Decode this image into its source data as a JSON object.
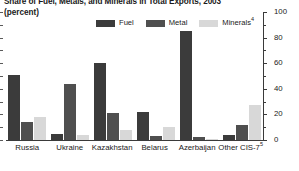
{
  "title": {
    "line1": "Share of Fuel, Metals, and Minerals in Total Exports, 2003",
    "line1_sup": "3",
    "line2": "(percent)"
  },
  "legend": {
    "position": "top-center",
    "items": [
      {
        "label": "Fuel",
        "sup": "",
        "color": "#3b3b3b"
      },
      {
        "label": "Metal",
        "sup": "",
        "color": "#4f4f4f"
      },
      {
        "label": "Minerals",
        "sup": "4",
        "color": "#d8d8d8"
      }
    ]
  },
  "axis": {
    "y_side": "right",
    "ticks": [
      "0",
      "20",
      "40",
      "60",
      "80",
      "100"
    ],
    "y_min": 0,
    "y_max": 100
  },
  "chart_data": {
    "type": "bar",
    "title": "Share of Fuel, Metals, and Minerals in Total Exports, 2003",
    "subtitle": "(percent)",
    "xlabel": "",
    "ylabel": "percent",
    "ylim": [
      0,
      100
    ],
    "yticks": [
      0,
      20,
      40,
      60,
      80,
      100
    ],
    "grid": false,
    "legend_position": "top-center",
    "categories": [
      "Russia",
      "Ukraine",
      "Kazakhstan",
      "Belarus",
      "Azerbaijan",
      "Other CIS-7"
    ],
    "category_sups": [
      "",
      "",
      "",
      "",
      "",
      "5"
    ],
    "series": [
      {
        "name": "Fuel",
        "color": "#3b3b3b",
        "values": [
          51,
          5,
          60,
          22,
          85,
          4
        ]
      },
      {
        "name": "Metal",
        "color": "#4f4f4f",
        "values": [
          14,
          44,
          21,
          3,
          2,
          12
        ]
      },
      {
        "name": "Minerals",
        "color": "#d8d8d8",
        "values": [
          18,
          4,
          8,
          10,
          1,
          27
        ]
      }
    ]
  }
}
